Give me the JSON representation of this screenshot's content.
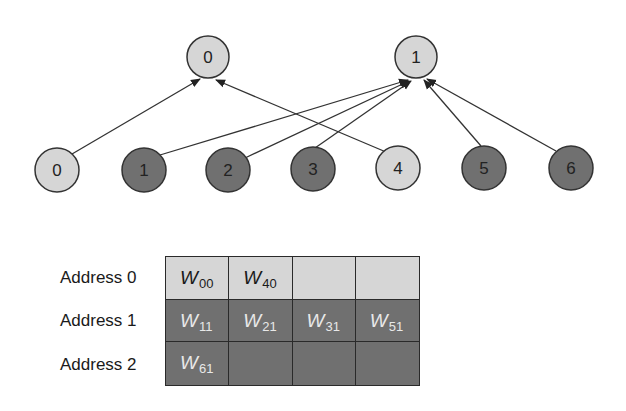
{
  "colors": {
    "light_fill": "#d6d6d6",
    "dark_fill": "#707070",
    "stroke": "#2a2a2a"
  },
  "output_nodes": [
    {
      "label": "0",
      "fill": "light"
    },
    {
      "label": "1",
      "fill": "light"
    }
  ],
  "input_nodes": [
    {
      "label": "0",
      "fill": "light"
    },
    {
      "label": "1",
      "fill": "dark"
    },
    {
      "label": "2",
      "fill": "dark"
    },
    {
      "label": "3",
      "fill": "dark"
    },
    {
      "label": "4",
      "fill": "light"
    },
    {
      "label": "5",
      "fill": "dark"
    },
    {
      "label": "6",
      "fill": "dark"
    }
  ],
  "edges": [
    {
      "from_input": "0",
      "to_output": "0"
    },
    {
      "from_input": "4",
      "to_output": "0"
    },
    {
      "from_input": "1",
      "to_output": "1"
    },
    {
      "from_input": "2",
      "to_output": "1"
    },
    {
      "from_input": "3",
      "to_output": "1"
    },
    {
      "from_input": "5",
      "to_output": "1"
    },
    {
      "from_input": "6",
      "to_output": "1"
    }
  ],
  "memory": {
    "rows": [
      {
        "label": "Address 0",
        "fill": "light",
        "cells": [
          {
            "w": "W",
            "sub": "00"
          },
          {
            "w": "W",
            "sub": "40"
          },
          {
            "w": "",
            "sub": ""
          },
          {
            "w": "",
            "sub": ""
          }
        ]
      },
      {
        "label": "Address 1",
        "fill": "dark",
        "cells": [
          {
            "w": "W",
            "sub": "11"
          },
          {
            "w": "W",
            "sub": "21"
          },
          {
            "w": "W",
            "sub": "31"
          },
          {
            "w": "W",
            "sub": "51"
          }
        ]
      },
      {
        "label": "Address 2",
        "fill": "dark",
        "cells": [
          {
            "w": "W",
            "sub": "61"
          },
          {
            "w": "",
            "sub": ""
          },
          {
            "w": "",
            "sub": ""
          },
          {
            "w": "",
            "sub": ""
          }
        ]
      }
    ]
  }
}
